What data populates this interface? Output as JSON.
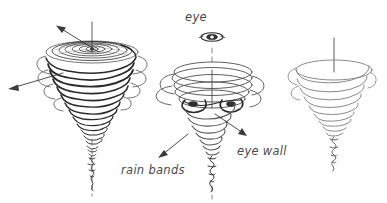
{
  "figure": {
    "title": "",
    "background_color": "#ffffff",
    "ink_color": "#2a2a2a",
    "label_color": "#4a4a4a",
    "style": "hand-drawn pen sketch"
  },
  "labels": {
    "eye": "eye",
    "rain_bands": "rain bands",
    "eye_wall": "eye wall"
  },
  "vortices": [
    {
      "name": "dense-vortex-left",
      "description": "heavily shaded spiral funnel with central eye and two outflow arrows",
      "center_x": 92,
      "top_y": 38,
      "bottom_y": 186,
      "top_radius": 46,
      "shading": "dark"
    },
    {
      "name": "open-vortex-middle",
      "description": "open ring spiral funnel showing eye wall and rain bands",
      "center_x": 212,
      "top_y": 62,
      "bottom_y": 190,
      "top_radius": 40,
      "shading": "medium"
    },
    {
      "name": "light-vortex-right",
      "description": "light outline spiral funnel",
      "center_x": 334,
      "top_y": 60,
      "bottom_y": 176,
      "top_radius": 38,
      "shading": "light"
    }
  ],
  "arrows": [
    {
      "name": "outflow-arrow-top",
      "from": [
        98,
        52
      ],
      "to": [
        58,
        27
      ],
      "points_to": "upper-left outflow"
    },
    {
      "name": "outflow-arrow-side",
      "from": [
        62,
        73
      ],
      "to": [
        10,
        88
      ],
      "points_to": "left outflow"
    },
    {
      "name": "rain-bands-pointer",
      "from": [
        187,
        135
      ],
      "to": [
        160,
        156
      ],
      "points_to": "rain bands"
    },
    {
      "name": "eye-wall-pointer",
      "from": [
        214,
        113
      ],
      "to": [
        245,
        134
      ],
      "points_to": "eye wall"
    }
  ],
  "axes": [
    {
      "name": "axis-left",
      "x": 92,
      "segments": [
        [
          22,
          52
        ],
        [
          140,
          196
        ]
      ]
    },
    {
      "name": "axis-middle",
      "x": 212,
      "segments": [
        [
          48,
          66
        ],
        [
          188,
          199
        ]
      ]
    },
    {
      "name": "axis-right",
      "x": 334,
      "segments": [
        [
          38,
          70
        ]
      ]
    }
  ],
  "eye_symbol": {
    "name": "eye-ellipse",
    "cx": 212,
    "cy": 37,
    "rx": 11,
    "ry": 4
  }
}
